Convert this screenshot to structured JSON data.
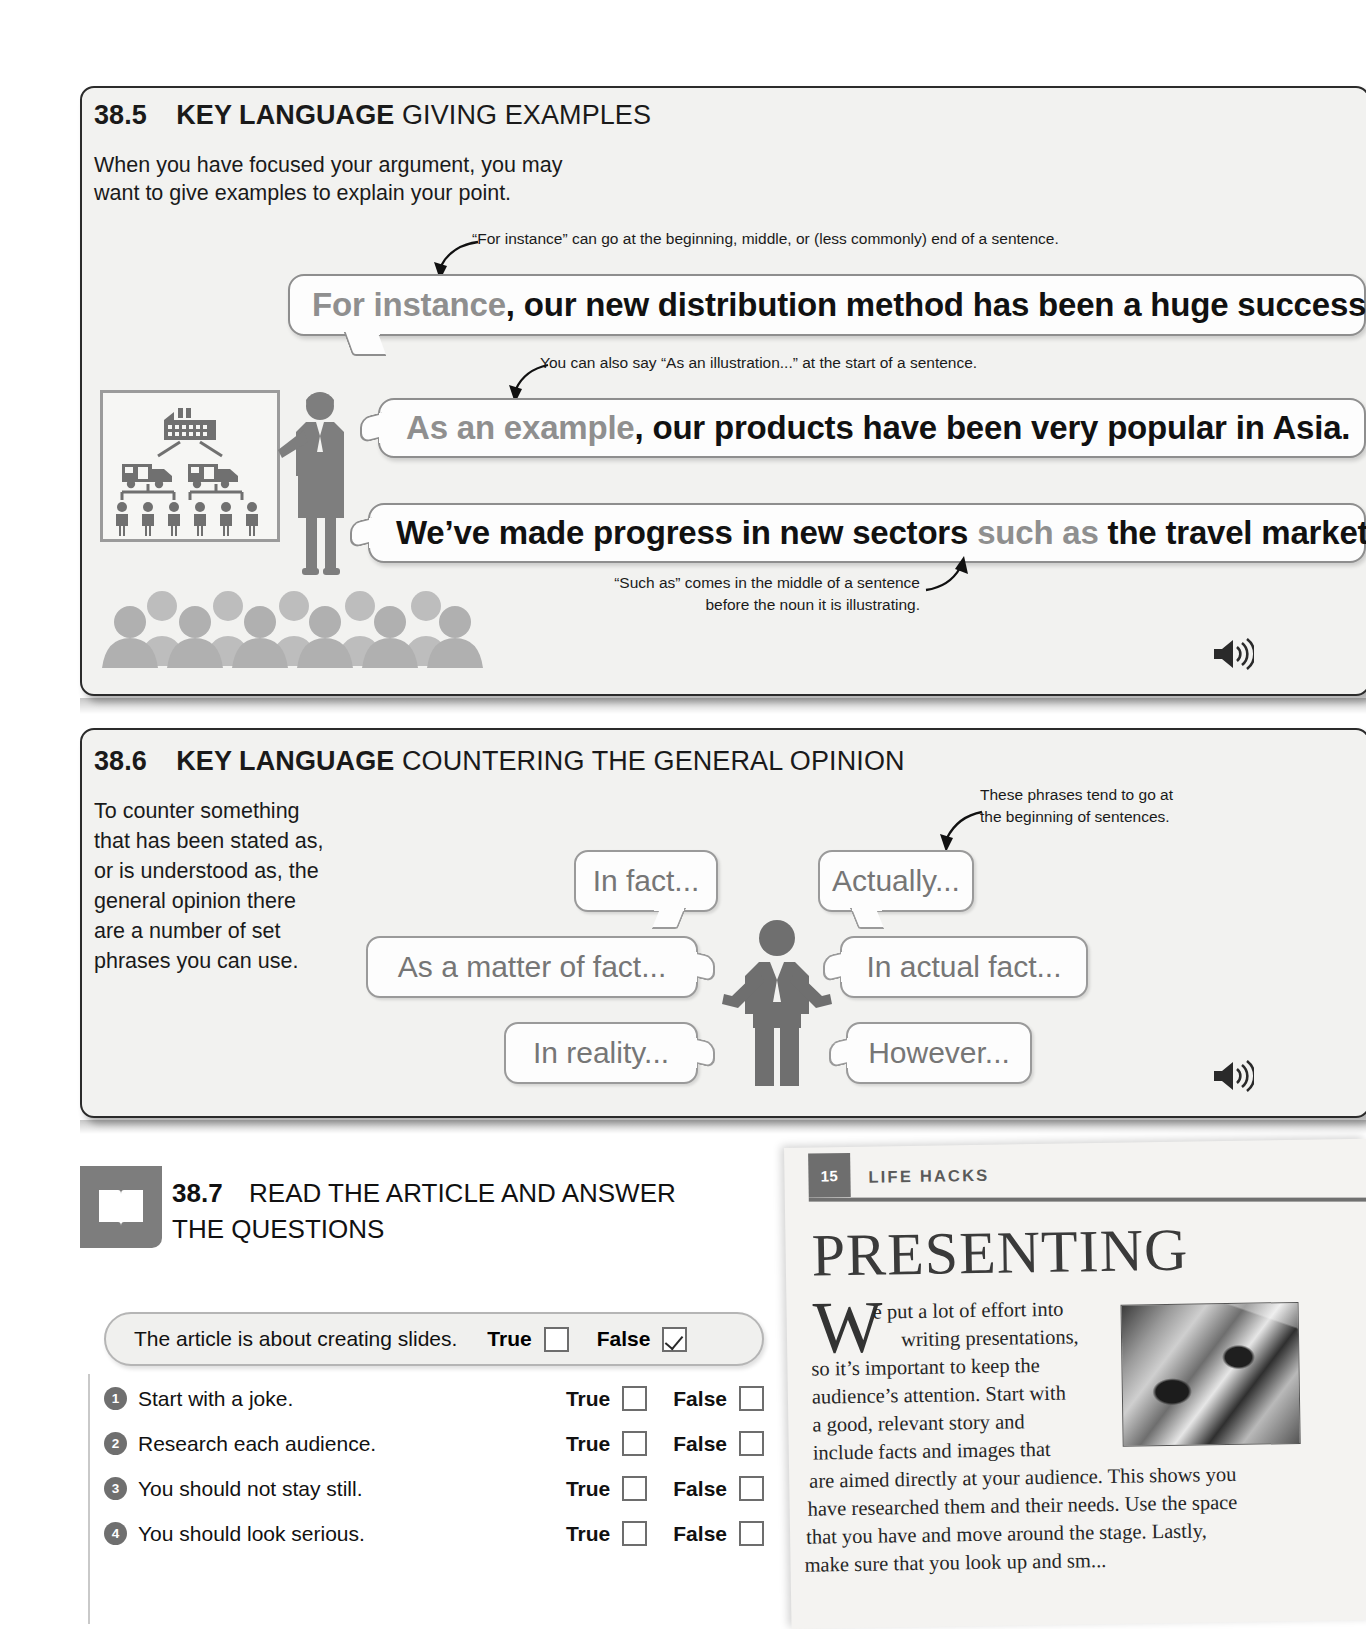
{
  "section_385": {
    "number": "38.5",
    "key_language": "KEY LANGUAGE",
    "title": "GIVING EXAMPLES",
    "intro_line1": "When you have focused your argument, you may",
    "intro_line2": "want to give examples to explain your point.",
    "note_1": "“For instance” can go at the beginning, middle, or (less commonly) end of a sentence.",
    "note_2": "You can also say “As an illustration...” at the start of a sentence.",
    "note_3_line1": "“Such as” comes in the middle of a sentence",
    "note_3_line2": "before the noun it is illustrating.",
    "bubbles": [
      {
        "highlight": "For instance",
        "rest": ", our new distribution method has been a huge success."
      },
      {
        "highlight": "As an example",
        "rest": ", our products have been very popular in Asia."
      },
      {
        "pre": "We’ve made progress in new sectors ",
        "highlight": "such as",
        "rest": " the travel market."
      }
    ],
    "audio_icon": "speaker-icon"
  },
  "section_386": {
    "number": "38.6",
    "key_language": "KEY LANGUAGE",
    "title": "COUNTERING THE GENERAL OPINION",
    "intro": "To counter something that has been stated as, or is understood as, the general opinion there are a number of set phrases you can use.",
    "note_line1": "These phrases tend to go at",
    "note_line2": "the beginning of sentences.",
    "phrases": [
      "In fact...",
      "Actually...",
      "As a matter of fact...",
      "In actual fact...",
      "In reality...",
      "However..."
    ],
    "audio_icon": "speaker-icon"
  },
  "section_387": {
    "icon": "book-icon",
    "number": "38.7",
    "title_line1": "READ THE ARTICLE AND ANSWER",
    "title_line2": "THE QUESTIONS",
    "example": {
      "text": "The article is about creating slides.",
      "true_label": "True",
      "false_label": "False",
      "true_checked": false,
      "false_checked": true
    },
    "questions": [
      {
        "num": "1",
        "text": "Start with a joke.",
        "true_label": "True",
        "false_label": "False",
        "true_checked": false,
        "false_checked": false
      },
      {
        "num": "2",
        "text": "Research each audience.",
        "true_label": "True",
        "false_label": "False",
        "true_checked": false,
        "false_checked": false
      },
      {
        "num": "3",
        "text": "You should not stay still.",
        "true_label": "True",
        "false_label": "False",
        "true_checked": false,
        "false_checked": false
      },
      {
        "num": "4",
        "text": "You should look serious.",
        "true_label": "True",
        "false_label": "False",
        "true_checked": false,
        "false_checked": false
      }
    ]
  },
  "article": {
    "badge": "15",
    "kicker": "LIFE HACKS",
    "title": "PRESENTING",
    "dropcap": "W",
    "para_lines": [
      "e put a lot of effort into",
      "writing presentations,",
      "so it’s important to keep the",
      "audience’s attention. Start with",
      "a good, relevant story and",
      "include facts and images that",
      "are aimed directly at your audience. This shows you",
      "have researched them and their needs. Use the space",
      "that you have and move around the stage. Lastly,",
      "make sure that you look up and sm..."
    ]
  },
  "colors": {
    "panel_bg": "#f2f2f0",
    "panel_border": "#2b2b2b",
    "bubble_border": "#8e8e8e",
    "gray_text": "#8f8f8f",
    "illustration_gray": "#7a7a7a",
    "audience_gray": "#b8b8b8",
    "badge_gray": "#6e6e6e"
  }
}
